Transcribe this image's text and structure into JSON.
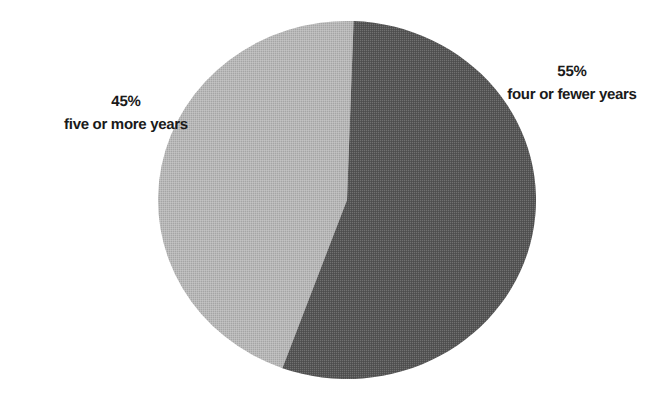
{
  "chart_data": {
    "type": "pie",
    "title": "",
    "subtitle": "",
    "xlabel": "",
    "ylabel": "",
    "grid": false,
    "legend_position": "none",
    "labels_inline": true,
    "total": 100,
    "units": "percent",
    "center": {
      "x": 347,
      "y": 200
    },
    "radius_x": 189,
    "radius_y": 179,
    "start_angle_deg": -88,
    "direction": "clockwise",
    "categories": [
      "four or fewer years",
      "five or more years"
    ],
    "values": [
      55,
      45
    ],
    "slices": [
      {
        "name": "four or fewer years",
        "value": 55,
        "value_label": "55%",
        "color": "#555555",
        "side": "right",
        "label_position": "outside-right"
      },
      {
        "name": "five or more years",
        "value": 45,
        "value_label": "45%",
        "color": "#b8b8b8",
        "side": "left",
        "label_position": "outside-left"
      }
    ],
    "annotations": []
  },
  "labels": {
    "right": {
      "percent": "55%",
      "category": "four or fewer years"
    },
    "left": {
      "percent": "45%",
      "category": "five or more years"
    }
  },
  "colors": {
    "background": "#ffffff",
    "slice_dark": "#555555",
    "slice_light": "#b8b8b8",
    "slice_light_edge": "#aeaeae",
    "text": "#1a1a1a"
  }
}
